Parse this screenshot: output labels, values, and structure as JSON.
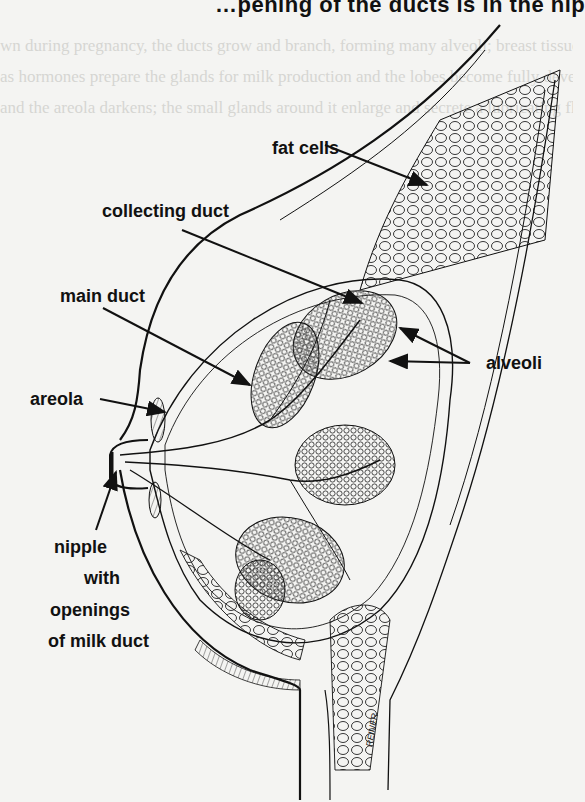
{
  "diagram": {
    "top_text_fragment": "…pening of the ducts is in the nip",
    "labels": [
      {
        "id": "fat-cells",
        "text": "fat cells"
      },
      {
        "id": "collecting-duct",
        "text": "collecting duct"
      },
      {
        "id": "main-duct",
        "text": "main duct"
      },
      {
        "id": "alveoli",
        "text": "alveoli"
      },
      {
        "id": "areola",
        "text": "areola"
      },
      {
        "id": "nipple",
        "lines": [
          "nipple",
          "with",
          "openings",
          "of milk duct"
        ]
      }
    ],
    "signature": "REINER",
    "colors": {
      "ink": "#111111",
      "paper": "#f4f4f2",
      "bleed_text": "#d6d6d2"
    }
  }
}
